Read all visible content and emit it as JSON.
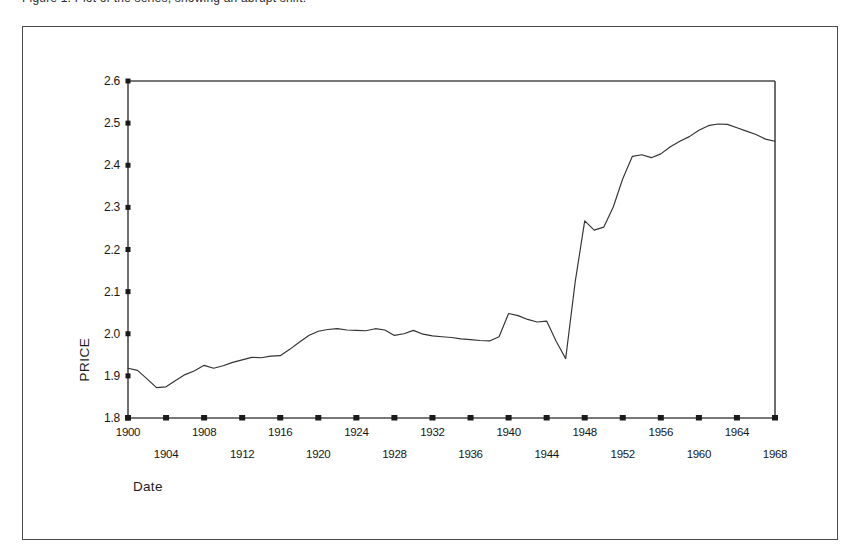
{
  "page": {
    "background_color": "#ffffff",
    "clipped_header_text": "Figure 1.  Plot of the series, showing an abrupt shift."
  },
  "frame": {
    "border_color": "#4a4a4a"
  },
  "chart_data": {
    "type": "line",
    "title": "",
    "xlabel": "Date",
    "ylabel": "PRICE",
    "xlim": [
      1900,
      1968
    ],
    "ylim": [
      1.8,
      2.6
    ],
    "grid": false,
    "legend": null,
    "line_color": "#333333",
    "axis_color": "#4a4a4a",
    "ytick_labels": [
      "2.6",
      "2.5",
      "2.4",
      "2.3",
      "2.2",
      "2.1",
      "2.0",
      "1.9",
      "1.8"
    ],
    "ytick_values": [
      2.6,
      2.5,
      2.4,
      2.3,
      2.2,
      2.1,
      2.0,
      1.9,
      1.8
    ],
    "xtick_values": [
      1900,
      1904,
      1908,
      1912,
      1916,
      1920,
      1924,
      1928,
      1932,
      1936,
      1940,
      1944,
      1948,
      1952,
      1956,
      1960,
      1964,
      1968
    ],
    "xtick_labels_upper": [
      "1900",
      "1908",
      "1916",
      "1924",
      "1932",
      "1940",
      "1948",
      "1956",
      "1964"
    ],
    "xtick_labels_lower": [
      "1904",
      "1912",
      "1920",
      "1928",
      "1936",
      "1944",
      "1952",
      "1960",
      "1968"
    ],
    "x": [
      1900,
      1901,
      1902,
      1903,
      1904,
      1905,
      1906,
      1907,
      1908,
      1909,
      1910,
      1911,
      1912,
      1913,
      1914,
      1915,
      1916,
      1917,
      1918,
      1919,
      1920,
      1921,
      1922,
      1923,
      1924,
      1925,
      1926,
      1927,
      1928,
      1929,
      1930,
      1931,
      1932,
      1933,
      1934,
      1935,
      1936,
      1937,
      1938,
      1939,
      1940,
      1941,
      1942,
      1943,
      1944,
      1945,
      1946,
      1947,
      1948,
      1949,
      1950,
      1951,
      1952,
      1953,
      1954,
      1955,
      1956,
      1957,
      1958,
      1959,
      1960,
      1961,
      1962,
      1963,
      1964,
      1965,
      1966,
      1967,
      1968
    ],
    "values": [
      1.918,
      1.913,
      1.893,
      1.872,
      1.874,
      1.889,
      1.903,
      1.912,
      1.925,
      1.918,
      1.924,
      1.932,
      1.938,
      1.944,
      1.943,
      1.947,
      1.948,
      1.963,
      1.98,
      1.996,
      2.006,
      2.01,
      2.012,
      2.009,
      2.008,
      2.007,
      2.012,
      2.009,
      1.996,
      2.0,
      2.008,
      1.999,
      1.995,
      1.993,
      1.991,
      1.988,
      1.986,
      1.984,
      1.983,
      1.993,
      2.048,
      2.043,
      2.034,
      2.028,
      2.03,
      1.982,
      1.941,
      2.123,
      2.268,
      2.246,
      2.253,
      2.301,
      2.368,
      2.421,
      2.425,
      2.418,
      2.427,
      2.444,
      2.457,
      2.468,
      2.483,
      2.494,
      2.498,
      2.497,
      2.489,
      2.481,
      2.473,
      2.462,
      2.457
    ],
    "annotations": []
  }
}
